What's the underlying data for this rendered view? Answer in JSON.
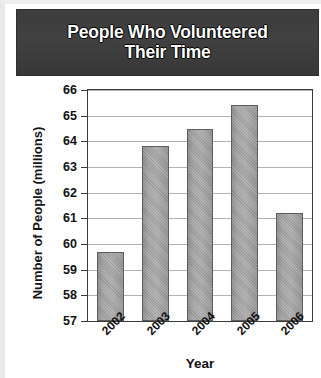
{
  "chart_data": {
    "type": "bar",
    "title": "People Who Volunteered Their Time",
    "title_line1": "People Who Volunteered",
    "title_line2": "Their Time",
    "xlabel": "Year",
    "ylabel": "Number of People (millions)",
    "categories": [
      "2002",
      "2003",
      "2004",
      "2005",
      "2006"
    ],
    "values": [
      59.7,
      63.8,
      64.5,
      65.4,
      61.2
    ],
    "ylim": [
      57,
      66
    ],
    "ytick_labels": [
      "57",
      "58",
      "59",
      "60",
      "61",
      "62",
      "63",
      "64",
      "65",
      "66"
    ],
    "ytick_values": [
      57,
      58,
      59,
      60,
      61,
      62,
      63,
      64,
      65,
      66
    ],
    "grid": true,
    "legend": false,
    "bar_color": "#a0a0a0",
    "title_background": "#3d3d3d",
    "title_color": "#ffffff",
    "axis_color": "#3a3a3a",
    "gridline_color": "#b3b3b3"
  }
}
